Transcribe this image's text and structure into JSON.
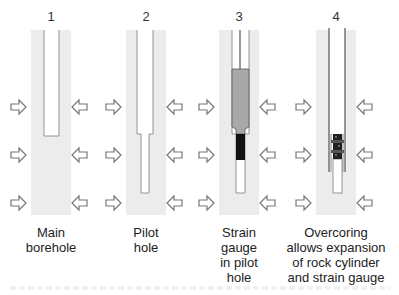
{
  "figure": {
    "panels": [
      {
        "number": "1",
        "caption": [
          "Main",
          "borehole"
        ],
        "stage": "main-borehole"
      },
      {
        "number": "2",
        "caption": [
          "Pilot",
          "hole"
        ],
        "stage": "pilot-hole"
      },
      {
        "number": "3",
        "caption": [
          "Strain",
          "gauge",
          "in pilot",
          "hole"
        ],
        "stage": "strain-gauge-installed"
      },
      {
        "number": "4",
        "caption": [
          "Overcoring",
          "allows expansion",
          "of rock cylinder",
          "and strain gauge"
        ],
        "stage": "overcoring"
      }
    ],
    "icons": {
      "stress_arrow": "hollow-arrow-icon"
    },
    "colors": {
      "rock": "#ececec",
      "hole_outline": "#8a8a8a",
      "probe": "#a8a8a8",
      "gauge": "#111111",
      "core_line": "#333333"
    }
  }
}
